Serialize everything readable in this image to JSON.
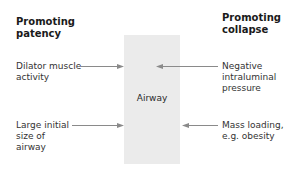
{
  "diagram": {
    "left_column": {
      "heading_line1": "Promoting",
      "heading_line2": "patency",
      "items": [
        {
          "line1": "Dilator muscle",
          "line2": "activity",
          "line3": ""
        },
        {
          "line1": "Large initial",
          "line2": "size of",
          "line3": "airway"
        }
      ]
    },
    "right_column": {
      "heading_line1": "Promoting",
      "heading_line2": "collapse",
      "items": [
        {
          "line1": "Negative",
          "line2": "intraluminal",
          "line3": "pressure"
        },
        {
          "line1": "Mass loading,",
          "line2": "e.g. obesity",
          "line3": ""
        }
      ]
    },
    "center": {
      "label": "Airway"
    },
    "colors": {
      "box_fill": "#ebebeb",
      "arrow": "#8a8a8a",
      "text": "#333333"
    }
  }
}
